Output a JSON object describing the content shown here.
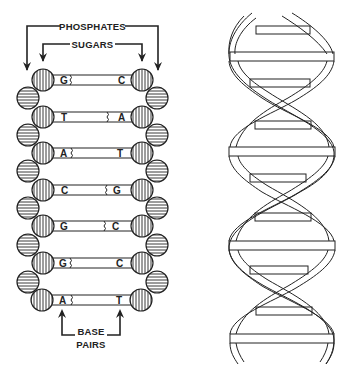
{
  "colors": {
    "ink": "#222222",
    "background": "#ffffff"
  },
  "ladder": {
    "labels": {
      "phosphates": "PHOSPHATES",
      "sugars": "SUGARS",
      "base_pairs_line1": "BASE",
      "base_pairs_line2": "PAIRS"
    },
    "rungs": [
      {
        "left": "G",
        "right": "C",
        "bond_side": "left"
      },
      {
        "left": "T",
        "right": "A",
        "bond_side": "right"
      },
      {
        "left": "A",
        "right": "T",
        "bond_side": "left"
      },
      {
        "left": "C",
        "right": "G",
        "bond_side": "right"
      },
      {
        "left": "G",
        "right": "C",
        "bond_side": "right"
      },
      {
        "left": "G",
        "right": "C",
        "bond_side": "left"
      },
      {
        "left": "A",
        "right": "T",
        "bond_side": "left"
      }
    ],
    "legend": {
      "sugar_icon": "vertical-striped-circle",
      "phosphate_icon": "horizontal-striped-circle"
    }
  },
  "helix": {
    "turns_label": "",
    "description": "ribbon double helix with base-pair bars"
  }
}
